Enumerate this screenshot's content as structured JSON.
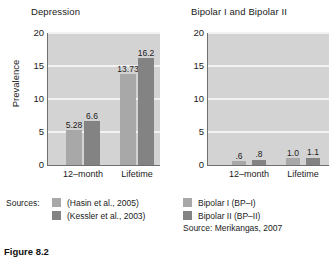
{
  "caption": "Figure 8.2",
  "colors": {
    "plot_background": "#d3d3d3",
    "gridline": "#f2f2f2",
    "axis": "#6f6f6f",
    "series_light": "#a8a8a8",
    "series_dark": "#838383",
    "text": "#1a1a1a"
  },
  "panels": [
    {
      "id": "depression",
      "title": "Depression",
      "ylabel": "Prevalence"
    },
    {
      "id": "bipolar",
      "title": "Bipolar I and Bipolar II",
      "ylabel": ""
    }
  ],
  "legend_left": {
    "sources_label": "Sources:",
    "items": [
      {
        "label": "(Hasin et al., 2005)",
        "color": "#a8a8a8"
      },
      {
        "label": "(Kessler et al., 2003)",
        "color": "#838383"
      }
    ]
  },
  "legend_right": {
    "items": [
      {
        "label": "Bipolar I (BP–I)",
        "color": "#a8a8a8"
      },
      {
        "label": "Bipolar II (BP–II)",
        "color": "#838383"
      }
    ],
    "source_line": "Source: Merikangas, 2007"
  },
  "chart_data": [
    {
      "type": "bar",
      "id": "depression",
      "title": "Depression",
      "xlabel": "",
      "ylabel": "Prevalence",
      "categories": [
        "12–month",
        "Lifetime"
      ],
      "yticks": [
        0,
        5,
        10,
        15,
        20
      ],
      "ylim": [
        0,
        20
      ],
      "grid": true,
      "legend_position": "below-left",
      "series": [
        {
          "name": "(Hasin et al., 2005)",
          "color": "#a8a8a8",
          "values": [
            5.28,
            13.73
          ],
          "labels": [
            "5.28",
            "13.73"
          ]
        },
        {
          "name": "(Kessler et al., 2003)",
          "color": "#838383",
          "values": [
            6.6,
            16.2
          ],
          "labels": [
            "6.6",
            "16.2"
          ]
        }
      ]
    },
    {
      "type": "bar",
      "id": "bipolar",
      "title": "Bipolar I and Bipolar II",
      "xlabel": "",
      "ylabel": "",
      "categories": [
        "12–month",
        "Lifetime"
      ],
      "yticks": [
        0,
        5,
        10,
        15,
        20
      ],
      "ylim": [
        0,
        20
      ],
      "grid": true,
      "legend_position": "below-right",
      "series": [
        {
          "name": "Bipolar I (BP–I)",
          "color": "#a8a8a8",
          "values": [
            0.6,
            1.0
          ],
          "labels": [
            ".6",
            "1.0"
          ]
        },
        {
          "name": "Bipolar II (BP–II)",
          "color": "#838383",
          "values": [
            0.8,
            1.1
          ],
          "labels": [
            ".8",
            "1.1"
          ]
        }
      ]
    }
  ]
}
